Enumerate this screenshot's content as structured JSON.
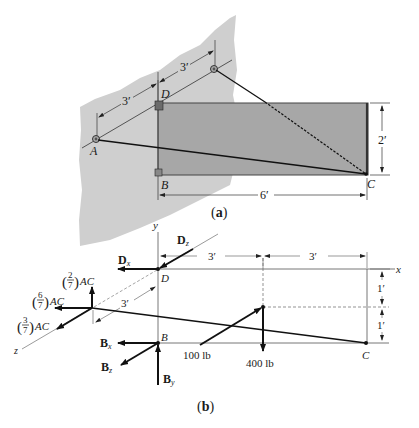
{
  "figure": {
    "part_a": {
      "caption": "(a)",
      "points": {
        "A": "A",
        "B": "B",
        "C": "C",
        "D": "D"
      },
      "dimensions": {
        "wall_spacing_1": "3′",
        "wall_spacing_2": "3′",
        "plate_height": "2′",
        "plate_width": "6′"
      }
    },
    "part_b": {
      "caption": "(b)",
      "axes": {
        "x": "x",
        "y": "y",
        "z": "z"
      },
      "points": {
        "B": "B",
        "C": "C",
        "D": "D"
      },
      "dimensions": {
        "top_left": "3′",
        "top_right": "3′",
        "side_upper": "1′",
        "side_lower": "1′",
        "z_offset": "3′"
      },
      "forces": {
        "Dx": {
          "bold": "D",
          "sub": "x"
        },
        "Dz": {
          "bold": "D",
          "sub": "z"
        },
        "Bx": {
          "bold": "B",
          "sub": "x"
        },
        "Bz": {
          "bold": "B",
          "sub": "z"
        },
        "By": {
          "bold": "B",
          "sub": "y"
        },
        "AC_y": {
          "num": "2",
          "den": "7",
          "suffix": "AC"
        },
        "AC_x": {
          "num": "6",
          "den": "7",
          "suffix": "AC"
        },
        "AC_z": {
          "num": "3",
          "den": "7",
          "suffix": "AC"
        },
        "load_100": "100 lb",
        "load_400": "400 lb"
      }
    }
  }
}
